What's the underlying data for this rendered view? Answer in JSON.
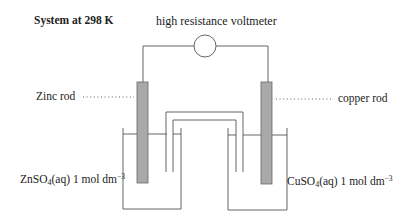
{
  "diagram": {
    "title": "System at 298 K",
    "voltmeter_label": "high resistance voltmeter",
    "left_electrode": {
      "label": "Zinc rod",
      "leader": "dotted"
    },
    "right_electrode": {
      "label": "copper rod",
      "leader": "dotted"
    },
    "left_solution": {
      "formula_prefix": "ZnSO",
      "formula_subscript": "4",
      "formula_suffix": "(aq)",
      "concentration": "1 mol dm",
      "concentration_exponent": "−3"
    },
    "right_solution": {
      "formula_prefix": "CuSO",
      "formula_subscript": "4",
      "formula_suffix": "(aq)",
      "concentration": "1 mol dm",
      "concentration_exponent": "−3"
    },
    "components": [
      "voltmeter",
      "zinc rod",
      "copper rod",
      "left beaker",
      "right beaker",
      "salt bridge",
      "external wire"
    ],
    "colors": {
      "line": "#555555",
      "rod_fill": "#a9a9a9",
      "rod_stroke": "#666666",
      "text": "#222222",
      "background": "#ffffff"
    }
  }
}
